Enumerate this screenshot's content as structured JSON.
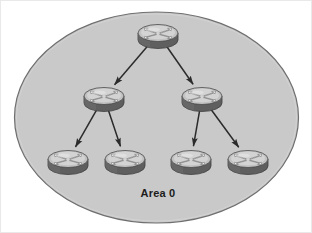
{
  "diagram": {
    "title": "Area 0",
    "type": "network-topology",
    "label": {
      "text": "Area 0",
      "x": 157,
      "y": 196
    },
    "area_boundary": {
      "name": "area-0-ellipse",
      "shape": "ellipse",
      "cx": 155.5,
      "cy": 116.5,
      "rx": 142,
      "ry": 105.5,
      "fill": "#c9c9c9",
      "stroke": "#6f6f6f"
    },
    "colors": {
      "canvas_background": "#ffffff",
      "area_fill": "#c9c9c9",
      "area_stroke": "#6f6f6f",
      "router_body": "#6e6e6e",
      "router_body_shade": "#5a5a5a",
      "router_top": "#bdbdbd",
      "router_top_highlight": "#e2e2e2",
      "router_outline": "#4a4a4a",
      "link_color": "#2b2b2b",
      "label_color": "#1c1c1c"
    },
    "routers": [
      {
        "id": "r-core",
        "name": "router-core",
        "tier": "core",
        "x": 157,
        "y": 33
      },
      {
        "id": "r-dist-left",
        "name": "router-dist-left",
        "tier": "distribution",
        "x": 103,
        "y": 96
      },
      {
        "id": "r-dist-right",
        "name": "router-dist-right",
        "tier": "distribution",
        "x": 201,
        "y": 96
      },
      {
        "id": "r-access-1",
        "name": "router-access-1",
        "tier": "access",
        "x": 67,
        "y": 159
      },
      {
        "id": "r-access-2",
        "name": "router-access-2",
        "tier": "access",
        "x": 124,
        "y": 159
      },
      {
        "id": "r-access-3",
        "name": "router-access-3",
        "tier": "access",
        "x": 190,
        "y": 159
      },
      {
        "id": "r-access-4",
        "name": "router-access-4",
        "tier": "access",
        "x": 247,
        "y": 159
      }
    ],
    "links": [
      {
        "name": "link-core-to-dist-left",
        "from": "r-core",
        "to": "r-dist-left",
        "bidirectional": true
      },
      {
        "name": "link-core-to-dist-right",
        "from": "r-core",
        "to": "r-dist-right",
        "bidirectional": true
      },
      {
        "name": "link-dist-left-access-1",
        "from": "r-dist-left",
        "to": "r-access-1",
        "bidirectional": true
      },
      {
        "name": "link-dist-left-access-2",
        "from": "r-dist-left",
        "to": "r-access-2",
        "bidirectional": true
      },
      {
        "name": "link-dist-right-access-3",
        "from": "r-dist-right",
        "to": "r-access-3",
        "bidirectional": true
      },
      {
        "name": "link-dist-right-access-4",
        "from": "r-dist-right",
        "to": "r-access-4",
        "bidirectional": true
      }
    ]
  }
}
